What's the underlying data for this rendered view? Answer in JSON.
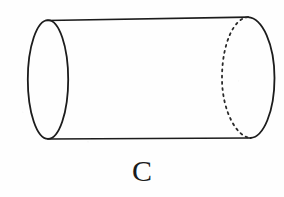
{
  "figure": {
    "label": "C",
    "shape_name": "cylinder",
    "stroke_color": "#1c1c1c",
    "dash_color": "#2a2a2a",
    "fill_color": "none",
    "background_color": "#fefefe",
    "stroke_width": 1.6,
    "geometry": {
      "left_face": {
        "type": "ellipse",
        "center_x": 48,
        "center_y": 79,
        "radius_x": 20,
        "radius_y": 59,
        "style": "solid",
        "visible": "full"
      },
      "right_face": {
        "type": "ellipse",
        "center_x": 248,
        "center_y": 78,
        "radius_x": 26,
        "radius_y": 61,
        "visible_half": "right-solid",
        "hidden_half": "left-dashed"
      },
      "top_edge": {
        "type": "line",
        "x1": 47,
        "y1": 20,
        "x2": 248,
        "y2": 17,
        "style": "solid"
      },
      "bottom_edge": {
        "type": "line",
        "x1": 48,
        "y1": 139,
        "x2": 250,
        "y2": 138,
        "style": "solid"
      },
      "dash_pattern": "2 4"
    }
  },
  "caption": {
    "text": "C",
    "x": 151,
    "y": 175,
    "font_size_px": 30
  }
}
